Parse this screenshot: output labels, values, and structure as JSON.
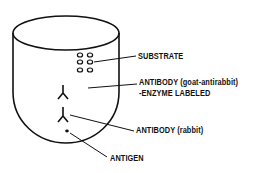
{
  "diagram": {
    "type": "ELISA well schematic",
    "labels": {
      "substrate": "SUBSTRATE",
      "secondary_antibody_line1": "ANTIBODY (goat-antirabbit)",
      "secondary_antibody_line2": "-ENZYME LABELED",
      "primary_antibody": "ANTIBODY (rabbit)",
      "antigen": "ANTIGEN"
    },
    "colors": {
      "ink": "#111111",
      "background": "#ffffff"
    }
  }
}
